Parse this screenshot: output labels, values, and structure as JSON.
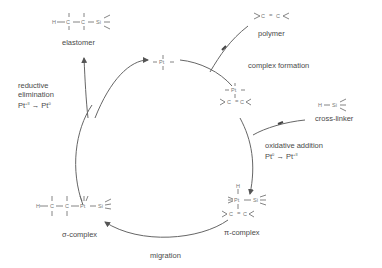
{
  "diagram": {
    "type": "catalytic-cycle",
    "stroke_color": "#555555",
    "text_color": "#4a4a4a",
    "nodes": {
      "catalyst": {
        "formula": "Pt"
      },
      "pt_alkene_complex": {
        "formula": "Pt / C=C"
      },
      "pi_complex": {
        "label": "π-complex",
        "formula": "H-Pt(Si) / C=C"
      },
      "sigma_complex": {
        "label": "σ-complex",
        "formula": "H-C-C-Pt-Si"
      }
    },
    "reagents": {
      "polymer": {
        "label": "polymer",
        "formula": "C=C"
      },
      "cross_linker": {
        "label": "cross-linker",
        "formula": "H-Si"
      }
    },
    "product": {
      "label": "elastomer",
      "formula": "H-C-C-Si"
    },
    "steps": {
      "complex_formation": {
        "label": "complex formation"
      },
      "oxidative_addition": {
        "line1": "oxidative addition",
        "from": "Pt",
        "from_ox": "0",
        "to": "Pt",
        "to_ox": "+II"
      },
      "migration": {
        "label": "migration"
      },
      "reductive_elimination": {
        "line1": "reductive",
        "line2": "elimination",
        "from": "Pt",
        "from_ox": "+II",
        "to": "Pt",
        "to_ox": "0"
      }
    },
    "atoms": {
      "H": "H",
      "C": "C",
      "Si": "Si",
      "Pt": "Pt"
    }
  }
}
